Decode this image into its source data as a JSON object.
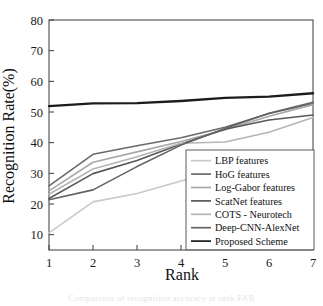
{
  "chart_data": {
    "type": "line",
    "title": "",
    "xlabel": "Rank",
    "ylabel": "Recognition Rate(%)",
    "x": [
      1,
      2,
      3,
      4,
      5,
      6,
      7
    ],
    "xlim": [
      1,
      7
    ],
    "ylim": [
      5,
      80
    ],
    "xticks": [
      "1",
      "2",
      "3",
      "4",
      "5",
      "6",
      "7"
    ],
    "yticks": [
      "10",
      "20",
      "30",
      "40",
      "50",
      "60",
      "70",
      "80"
    ],
    "grid": false,
    "legend_position": "lower-right",
    "series": [
      {
        "name": "LBP features",
        "values": [
          10.6,
          20.7,
          23.4,
          27.5,
          31.5,
          35.8,
          37.0
        ],
        "color": "#c9c9c9",
        "width": 1.6
      },
      {
        "name": "HoG features",
        "values": [
          25.9,
          36.2,
          39.0,
          41.6,
          45.0,
          49.5,
          52.8
        ],
        "color": "#6a6a6a",
        "width": 1.6
      },
      {
        "name": "Log-Gabor features",
        "values": [
          24.3,
          33.6,
          37.0,
          40.4,
          44.2,
          48.6,
          52.4
        ],
        "color": "#a8a8a8",
        "width": 1.6
      },
      {
        "name": "ScatNet features",
        "values": [
          21.8,
          29.9,
          34.2,
          39.6,
          44.4,
          47.4,
          49.0
        ],
        "color": "#585858",
        "width": 1.6
      },
      {
        "name": "COTS - Neurotech",
        "values": [
          23.2,
          31.4,
          35.4,
          39.8,
          40.2,
          43.4,
          48.2
        ],
        "color": "#b5b5b5",
        "width": 1.6
      },
      {
        "name": "Deep-CNN-AlexNet",
        "values": [
          21.4,
          24.6,
          32.2,
          39.2,
          44.6,
          49.6,
          53.2
        ],
        "color": "#636363",
        "width": 1.6
      },
      {
        "name": "Proposed Scheme",
        "values": [
          51.9,
          52.8,
          52.9,
          53.6,
          54.6,
          55.0,
          56.1
        ],
        "color": "#1c1c1c",
        "width": 2.4
      }
    ]
  },
  "caption": {
    "partial_text": "Comparison of recognition accuracy at rank FAR"
  }
}
